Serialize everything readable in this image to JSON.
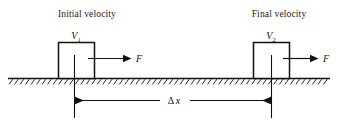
{
  "figure": {
    "type": "physics-free-body-diagram",
    "background_color": "#ffffff",
    "ink_color": "#111111"
  },
  "states": [
    {
      "id": "initial",
      "caption": "Initial velocity",
      "velocity_symbol": "V",
      "velocity_subscript": "1",
      "force_label": "F",
      "force_direction": "right"
    },
    {
      "id": "final",
      "caption": "Final velocity",
      "velocity_symbol": "V",
      "velocity_subscript": "2",
      "force_label": "F",
      "force_direction": "right"
    }
  ],
  "dimension": {
    "label_delta": "Δ",
    "label_variable": "x",
    "label_full": "Δx",
    "style": "double-headed-arrow"
  },
  "ground": {
    "name": "hatched-ground-surface",
    "hatch_count": 58
  }
}
